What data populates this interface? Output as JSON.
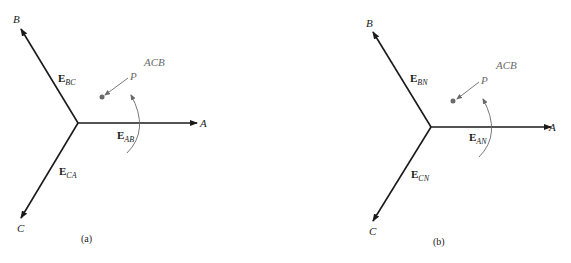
{
  "figure": {
    "panels": [
      {
        "caption": "(a)",
        "axes": {
          "A": "A",
          "B": "B",
          "C": "C"
        },
        "vectors": [
          {
            "base": "E",
            "sub": "AB"
          },
          {
            "base": "E",
            "sub": "BC"
          },
          {
            "base": "E",
            "sub": "CA"
          }
        ],
        "sequence": "ACB",
        "point": "P"
      },
      {
        "caption": "(b)",
        "axes": {
          "A": "A",
          "B": "B",
          "C": "C"
        },
        "vectors": [
          {
            "base": "E",
            "sub": "AN"
          },
          {
            "base": "E",
            "sub": "BN"
          },
          {
            "base": "E",
            "sub": "CN"
          }
        ],
        "sequence": "ACB",
        "point": "P"
      }
    ],
    "colors": {
      "phasor": "#1a1a1a",
      "annotation": "#6a6a6a"
    }
  }
}
